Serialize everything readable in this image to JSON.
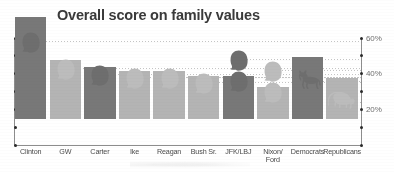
{
  "chart_data": {
    "type": "bar",
    "title": "Overall score on family values",
    "xlabel": "",
    "ylabel": "",
    "ylim": [
      0,
      65
    ],
    "grid": "dotted-leader-lines",
    "legend": "none",
    "axis_ticks": [
      {
        "value": 60,
        "label": "60%"
      },
      {
        "value": 50,
        "label": ""
      },
      {
        "value": 40,
        "label": "40%"
      },
      {
        "value": 30,
        "label": ""
      },
      {
        "value": 20,
        "label": "20%"
      },
      {
        "value": 10,
        "label": ""
      },
      {
        "value": 0,
        "label": ""
      }
    ],
    "categories": [
      "Clinton",
      "GW",
      "Carter",
      "Ike",
      "Reagan",
      "Bush Sr.",
      "JFK/LBJ",
      "Nixon/\nFord",
      "Democrats",
      "Republicans"
    ],
    "values": [
      57,
      33,
      29,
      27,
      27,
      24,
      24,
      18,
      35,
      23
    ],
    "bar_shades": [
      "dark",
      "light",
      "dark",
      "light",
      "light",
      "light",
      "dark",
      "light",
      "dark",
      "light"
    ],
    "marker_values": [
      62,
      47,
      44,
      42,
      42,
      39,
      52,
      46,
      40,
      28
    ],
    "markers": [
      "head-dark",
      "head-light",
      "head-dark",
      "head-light",
      "head-light",
      "head-light",
      "head-dark-pair",
      "head-light-pair",
      "donkey",
      "elephant"
    ]
  },
  "labels": {
    "categories": [
      {
        "line1": "Clinton",
        "line2": ""
      },
      {
        "line1": "GW",
        "line2": ""
      },
      {
        "line1": "Carter",
        "line2": ""
      },
      {
        "line1": "Ike",
        "line2": ""
      },
      {
        "line1": "Reagan",
        "line2": ""
      },
      {
        "line1": "Bush Sr.",
        "line2": ""
      },
      {
        "line1": "JFK/LBJ",
        "line2": ""
      },
      {
        "line1": "Nixon/",
        "line2": "Ford"
      },
      {
        "line1": "Democrats",
        "line2": ""
      },
      {
        "line1": "Republicans",
        "line2": ""
      }
    ],
    "axis": [
      "60%",
      "40%",
      "20%"
    ]
  },
  "colors": {
    "bar_dark": "#787878",
    "bar_light": "#b4b4b4",
    "title": "#3a3a3a",
    "axis": "#8d8d8d",
    "tick_text": "#6f6f6f",
    "background": "#ffffff"
  }
}
